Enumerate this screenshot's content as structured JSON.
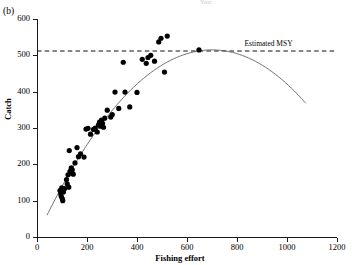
{
  "panel": {
    "label": "(b)",
    "top_clipped_text": "Year"
  },
  "annotations": {
    "msy_label": "Estimated MSY"
  },
  "chart_data": {
    "type": "scatter",
    "title": "",
    "xlabel": "Fishing effort",
    "ylabel": "Catch",
    "xlim": [
      0,
      1200
    ],
    "ylim": [
      0,
      600
    ],
    "xticks": [
      0,
      200,
      400,
      600,
      800,
      1000,
      1200
    ],
    "yticks": [
      0,
      100,
      200,
      300,
      400,
      500,
      600
    ],
    "grid": false,
    "legend": "none",
    "series": [
      {
        "name": "Observed catch vs effort",
        "marker": "filled-circle",
        "color": "#000000",
        "points": [
          [
            92,
            128
          ],
          [
            95,
            119
          ],
          [
            97,
            112
          ],
          [
            99,
            135
          ],
          [
            101,
            106
          ],
          [
            103,
            100
          ],
          [
            106,
            124
          ],
          [
            110,
            133
          ],
          [
            118,
            158
          ],
          [
            121,
            146
          ],
          [
            124,
            171
          ],
          [
            127,
            137
          ],
          [
            129,
            238
          ],
          [
            132,
            181
          ],
          [
            134,
            176
          ],
          [
            137,
            190
          ],
          [
            141,
            185
          ],
          [
            145,
            173
          ],
          [
            152,
            204
          ],
          [
            160,
            246
          ],
          [
            166,
            221
          ],
          [
            174,
            229
          ],
          [
            188,
            220
          ],
          [
            196,
            297
          ],
          [
            204,
            299
          ],
          [
            214,
            283
          ],
          [
            226,
            296
          ],
          [
            233,
            300
          ],
          [
            241,
            289
          ],
          [
            246,
            309
          ],
          [
            250,
            316
          ],
          [
            254,
            305
          ],
          [
            258,
            322
          ],
          [
            262,
            313
          ],
          [
            266,
            302
          ],
          [
            271,
            327
          ],
          [
            281,
            349
          ],
          [
            295,
            330
          ],
          [
            301,
            337
          ],
          [
            312,
            399
          ],
          [
            327,
            354
          ],
          [
            345,
            481
          ],
          [
            352,
            399
          ],
          [
            371,
            358
          ],
          [
            400,
            398
          ],
          [
            421,
            489
          ],
          [
            437,
            478
          ],
          [
            444,
            494
          ],
          [
            455,
            500
          ],
          [
            470,
            484
          ],
          [
            487,
            537
          ],
          [
            496,
            547
          ],
          [
            510,
            454
          ],
          [
            521,
            553
          ],
          [
            648,
            515
          ]
        ]
      }
    ],
    "fitted_curve": {
      "name": "Schaefer surplus production fit",
      "style": "solid",
      "color": "#555555",
      "x_start": 40,
      "x_end": 1075,
      "peak_x": 700,
      "peak_y": 515,
      "y_start": 60,
      "y_end": 390
    },
    "reference_line": {
      "name": "Estimated MSY",
      "style": "dashed",
      "orientation": "horizontal",
      "y": 512,
      "x_start": 0,
      "x_end": 1190
    }
  }
}
